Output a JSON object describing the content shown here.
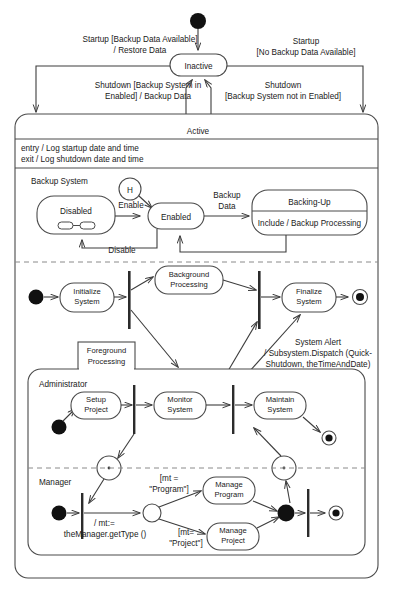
{
  "diagram": {
    "type": "uml-state-machine-diagram",
    "title": "",
    "top_states": {
      "inactive": "Inactive",
      "active": "Active"
    },
    "active_internal_actions": [
      "entry / Log startup date and time",
      "exit / Log shutdown date and time"
    ],
    "top_transitions": {
      "startup_restore_line1": "Startup [Backup Data Available]",
      "startup_restore_line2": "/ Restore Data",
      "startup_nobackup_line1": "Startup",
      "startup_nobackup_line2": "[No Backup Data Available]",
      "shutdown_backup_line1": "Shutdown [Backup System in",
      "shutdown_backup_line2": "Enabled] / Backup Data",
      "shutdown_nobackup_line1": "Shutdown",
      "shutdown_nobackup_line2": "[Backup System not in Enabled]"
    },
    "backup_region": {
      "label": "Backup System",
      "history": "H",
      "states": {
        "disabled": "Disabled",
        "enabled": "Enabled",
        "backing_up_name": "Backing-Up",
        "backing_up_body": "Include / Backup Processing"
      },
      "transitions": {
        "enable": "Enable",
        "disable": "Disable",
        "backup_data_line1": "Backup",
        "backup_data_line2": "Data"
      }
    },
    "activity_region": {
      "initialize_line1": "Initialize",
      "initialize_line2": "System",
      "background_line1": "Background",
      "background_line2": "Processing",
      "finalize_line1": "Finalize",
      "finalize_line2": "System",
      "alert_line1": "System Alert",
      "alert_line2": "/ Subsystem.Dispatch (Quick-",
      "alert_line3": "Shutdown, theTimeAndDate)"
    },
    "foreground_region": {
      "tab_line1": "Foreground",
      "tab_line2": "Processing",
      "swimlanes": [
        {
          "name": "Administrator",
          "actions": [
            {
              "line1": "Setup",
              "line2": "Project"
            },
            {
              "line1": "Monitor",
              "line2": "System"
            },
            {
              "line1": "Maintain",
              "line2": "System"
            }
          ]
        },
        {
          "name": "Manager",
          "actions": [
            {
              "line1": "Manage",
              "line2": "Program"
            },
            {
              "line1": "Manage",
              "line2": "Project"
            }
          ],
          "transitions": {
            "get_type_line1": "/ mt:=",
            "get_type_line2": "theManager.getType ()",
            "guard_program_line1": "[mt =",
            "guard_program_line2": "\"Program\"]",
            "guard_project_line1": "[mt=",
            "guard_project_line2": "\"Project\"]"
          }
        }
      ]
    },
    "colors": {
      "background": "#ffffff",
      "stroke": "#4a4a4a",
      "text": "#1a1a1a",
      "node_fill": "#111111",
      "dashed": "#8a8a8a"
    }
  }
}
